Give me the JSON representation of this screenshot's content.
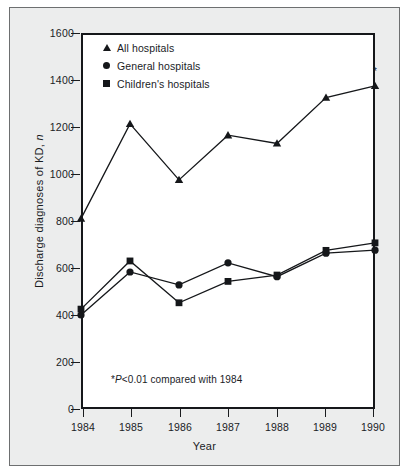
{
  "chart_data": {
    "type": "line",
    "title": "",
    "xlabel": "Year",
    "ylabel": "Discharge diagnoses of KD, n",
    "categories": [
      "1984",
      "1985",
      "1986",
      "1987",
      "1988",
      "1989",
      "1990"
    ],
    "x": [
      1984,
      1985,
      1986,
      1987,
      1988,
      1989,
      1990
    ],
    "xlim": [
      1984,
      1990
    ],
    "ylim": [
      0,
      1600
    ],
    "yticks": [
      0,
      200,
      400,
      600,
      800,
      1000,
      1200,
      1400,
      1600
    ],
    "ytick_labels": [
      "0",
      "200",
      "400",
      "600",
      "800",
      "1000",
      "1200",
      "1400",
      "1600"
    ],
    "grid": false,
    "legend_position": "top-left",
    "series": [
      {
        "name": "All hospitals",
        "marker": "triangle",
        "values": [
          810,
          1213,
          975,
          1165,
          1130,
          1325,
          1375
        ]
      },
      {
        "name": "General hospitals",
        "marker": "circle",
        "values": [
          400,
          583,
          528,
          622,
          563,
          663,
          676
        ]
      },
      {
        "name": "Children's hospitals",
        "marker": "square",
        "values": [
          425,
          630,
          452,
          543,
          570,
          675,
          707
        ]
      }
    ],
    "annotations": [
      {
        "text": "*",
        "x": 1990,
        "y": 1440,
        "note": "significance marker above 1990 All hospitals point"
      }
    ],
    "footnote": "*P<0.01 compared with 1984"
  },
  "legend": {
    "items": [
      {
        "label": "All hospitals",
        "marker": "triangle-marker"
      },
      {
        "label": "General hospitals",
        "marker": "circle-marker"
      },
      {
        "label": "Children's hospitals",
        "marker": "square-marker"
      }
    ]
  },
  "axes": {
    "x_title": "Year",
    "y_title_prefix": "Discharge diagnoses of KD, ",
    "y_title_italic": "n",
    "x_labels": [
      "1984",
      "1985",
      "1986",
      "1987",
      "1988",
      "1989",
      "1990"
    ],
    "y_labels": [
      "1600",
      "1400",
      "1200",
      "1000",
      "800",
      "600",
      "400",
      "200",
      "0"
    ]
  },
  "footnote": {
    "star": "*",
    "italic_p": "P",
    "rest": "<0.01 compared with 1984"
  },
  "colors": {
    "ink": "#15171a",
    "panel": "#eceded",
    "plot_background": "#ffffff",
    "panel_border": "#6d6f70"
  }
}
